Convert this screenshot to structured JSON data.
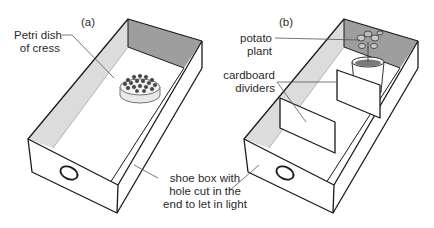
{
  "figure": {
    "panels": [
      {
        "id": "a",
        "tag": "(a)",
        "labels": {
          "petri_dish": [
            "Petri dish",
            "of cress"
          ],
          "shoe_box": [
            "shoe box with",
            "hole cut in the",
            "end to let in light"
          ]
        }
      },
      {
        "id": "b",
        "tag": "(b)",
        "labels": {
          "potato_plant": [
            "potato",
            "plant"
          ],
          "dividers": [
            "cardboard",
            "dividers"
          ]
        }
      }
    ],
    "colors": {
      "line": "#1a1a1a",
      "back_wall": "#9e9e9e",
      "side_wall": "#dcdcdc",
      "leader": "#555555",
      "soil": "#7a7a7a"
    }
  }
}
